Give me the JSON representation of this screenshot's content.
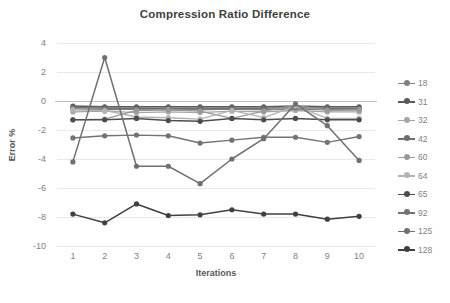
{
  "chart_data": {
    "type": "line",
    "title": "Compression Ratio Difference",
    "xlabel": "Iterations",
    "ylabel": "Error %",
    "x": [
      1,
      2,
      3,
      4,
      5,
      6,
      7,
      8,
      9,
      10
    ],
    "categories": [
      "1",
      "2",
      "3",
      "4",
      "5",
      "6",
      "7",
      "8",
      "9",
      "10"
    ],
    "xtick_labels": [
      "1",
      "2",
      "3",
      "4",
      "5",
      "6",
      "7",
      "8",
      "9",
      "10"
    ],
    "ytick_labels": [
      "4",
      "2",
      "0",
      "-2",
      "-4",
      "-6",
      "-8",
      "-10"
    ],
    "yticks": [
      4,
      2,
      0,
      -2,
      -4,
      -6,
      -8,
      -10
    ],
    "ylim": [
      -10,
      4
    ],
    "xlim": [
      0.5,
      10.5
    ],
    "grid": true,
    "grid_axis": "y",
    "legend_position": "right",
    "markers": "circle",
    "series": [
      {
        "name": "18",
        "color": "#808080",
        "width": 1.4,
        "values": [
          -0.55,
          -0.6,
          -0.55,
          -0.6,
          -0.6,
          -0.55,
          -0.6,
          -0.55,
          -0.6,
          -0.6
        ]
      },
      {
        "name": "31",
        "color": "#595959",
        "width": 1.4,
        "values": [
          -0.35,
          -0.4,
          -0.4,
          -0.4,
          -0.4,
          -0.4,
          -0.4,
          -0.35,
          -0.4,
          -0.4
        ]
      },
      {
        "name": "32",
        "color": "#a6a6a6",
        "width": 1.4,
        "values": [
          -0.75,
          -0.7,
          -0.8,
          -0.75,
          -0.8,
          -0.7,
          -0.75,
          -0.65,
          -0.75,
          -0.75
        ]
      },
      {
        "name": "42",
        "color": "#6e6e6e",
        "width": 1.4,
        "values": [
          -0.45,
          -0.5,
          -0.5,
          -0.5,
          -0.5,
          -0.5,
          -0.5,
          -0.45,
          -0.5,
          -0.5
        ]
      },
      {
        "name": "60",
        "color": "#999999",
        "width": 1.4,
        "values": [
          -1.3,
          -1.25,
          -0.65,
          -0.6,
          -0.7,
          -1.2,
          -0.7,
          -0.3,
          -0.65,
          -0.6
        ]
      },
      {
        "name": "64",
        "color": "#b3b3b3",
        "width": 1.4,
        "values": [
          -0.6,
          -0.65,
          -1.1,
          -1.15,
          -1.25,
          -0.65,
          -1.15,
          -0.35,
          -1.2,
          -1.2
        ]
      },
      {
        "name": "65",
        "color": "#4d4d4d",
        "width": 1.5,
        "values": [
          -1.3,
          -1.3,
          -1.2,
          -1.35,
          -1.4,
          -1.2,
          -1.3,
          -1.2,
          -1.3,
          -1.3
        ]
      },
      {
        "name": "92",
        "color": "#737373",
        "width": 1.4,
        "values": [
          -2.55,
          -2.4,
          -2.35,
          -2.4,
          -2.9,
          -2.7,
          -2.5,
          -2.5,
          -2.85,
          -2.45
        ]
      },
      {
        "name": "125",
        "color": "#707070",
        "width": 1.5,
        "values": [
          -4.2,
          3.0,
          -4.5,
          -4.5,
          -5.7,
          -4.0,
          -2.6,
          -0.2,
          -1.7,
          -4.1
        ]
      },
      {
        "name": "128",
        "color": "#404040",
        "width": 1.5,
        "values": [
          -7.8,
          -8.4,
          -7.1,
          -7.9,
          -7.85,
          -7.5,
          -7.8,
          -7.8,
          -8.15,
          -7.95
        ]
      }
    ]
  },
  "legend": {
    "items": [
      {
        "label": "18"
      },
      {
        "label": "31"
      },
      {
        "label": "32"
      },
      {
        "label": "42"
      },
      {
        "label": "60"
      },
      {
        "label": "64"
      },
      {
        "label": "65"
      },
      {
        "label": "92"
      },
      {
        "label": "125"
      },
      {
        "label": "128"
      }
    ]
  },
  "colors": {
    "background": "#ffffff",
    "grid": "#e8e8e8",
    "zero_line": "#bfbfbf",
    "tick_text": "#7f7f7f",
    "title_text": "#404040"
  }
}
